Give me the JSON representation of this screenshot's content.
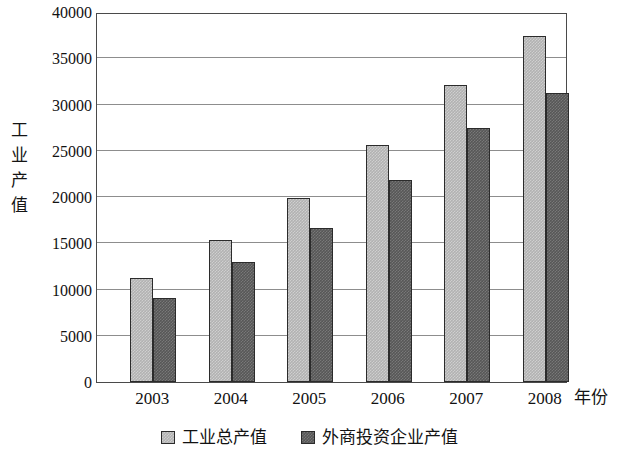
{
  "chart_data": {
    "type": "bar",
    "title": "",
    "subtitle": "",
    "xlabel": "年份",
    "ylabel": "工业产值",
    "categories": [
      "2003",
      "2004",
      "2005",
      "2006",
      "2007",
      "2008"
    ],
    "series": [
      {
        "name": "工业总产值",
        "color": "#b2b2b2",
        "values": [
          11200,
          15300,
          19900,
          25600,
          32100,
          37400
        ]
      },
      {
        "name": "外商投资企业产值",
        "color": "#575757",
        "values": [
          9100,
          13000,
          16700,
          21800,
          27500,
          31200
        ]
      }
    ],
    "ylim": [
      0,
      40000
    ],
    "ytick_values": [
      0,
      5000,
      10000,
      15000,
      20000,
      25000,
      30000,
      35000,
      40000
    ],
    "ytick_labels": [
      "0",
      "5000",
      "10000",
      "15000",
      "20000",
      "25000",
      "30000",
      "35000",
      "40000"
    ],
    "grid": true,
    "grid_axis": "y",
    "legend_position": "bottom-center",
    "frame": true,
    "bar_border_color": "#2b2b2b",
    "grid_color": "#8d8d8d",
    "frame_color": "#4a4a4a"
  }
}
